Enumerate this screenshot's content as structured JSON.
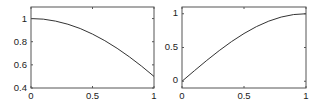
{
  "chart_data": [
    {
      "type": "line",
      "title": "",
      "xlabel": "",
      "ylabel": "",
      "xlim": [
        0,
        1
      ],
      "ylim": [
        0.4,
        1.1
      ],
      "grid": false,
      "legend": null,
      "x_ticks": [
        "0",
        "0.5",
        "1"
      ],
      "y_ticks": [
        "0.4",
        "0.6",
        "0.8",
        "1"
      ],
      "series": [
        {
          "name": "curve",
          "color": "#333333",
          "x": [
            0,
            0.1,
            0.2,
            0.3,
            0.4,
            0.5,
            0.6,
            0.7,
            0.8,
            0.9,
            1.0
          ],
          "y": [
            1.0,
            0.995,
            0.978,
            0.951,
            0.914,
            0.866,
            0.809,
            0.743,
            0.669,
            0.588,
            0.5
          ]
        }
      ]
    },
    {
      "type": "line",
      "title": "",
      "xlabel": "",
      "ylabel": "",
      "xlim": [
        0,
        1
      ],
      "ylim": [
        -0.1,
        1.1
      ],
      "grid": false,
      "legend": null,
      "x_ticks": [
        "0",
        "0.5",
        "1"
      ],
      "y_ticks": [
        "0",
        "0.5",
        "1"
      ],
      "series": [
        {
          "name": "curve",
          "color": "#333333",
          "x": [
            0,
            0.1,
            0.2,
            0.3,
            0.4,
            0.5,
            0.6,
            0.7,
            0.8,
            0.9,
            1.0
          ],
          "y": [
            0.0,
            0.156,
            0.309,
            0.454,
            0.588,
            0.707,
            0.809,
            0.891,
            0.951,
            0.988,
            1.0
          ]
        }
      ]
    }
  ],
  "labels": {
    "left": {
      "x": [
        "0",
        "0.5",
        "1"
      ],
      "y": [
        "0.4",
        "0.6",
        "0.8",
        "1"
      ]
    },
    "right": {
      "x": [
        "0",
        "0.5",
        "1"
      ],
      "y": [
        "0",
        "0.5",
        "1"
      ]
    }
  }
}
